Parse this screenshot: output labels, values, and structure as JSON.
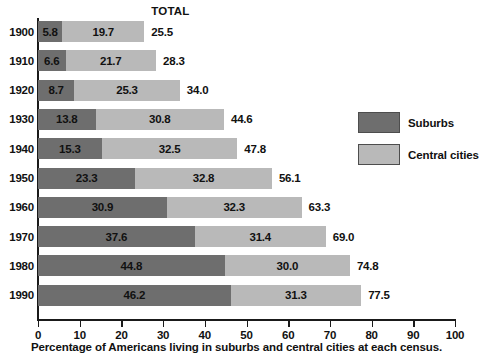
{
  "chart_data": {
    "type": "bar",
    "orientation": "horizontal",
    "stacked": true,
    "title": "",
    "caption": "Percentage of Americans living in suburbs and central cities at each census.",
    "total_header": "TOTAL",
    "xlabel": "",
    "ylabel": "",
    "xlim": [
      0,
      100
    ],
    "xticks": [
      0,
      10,
      20,
      30,
      40,
      50,
      60,
      70,
      80,
      90,
      100
    ],
    "xtick_labels": [
      "0",
      "10",
      "20",
      "30",
      "40",
      "50",
      "60",
      "70",
      "80",
      "90",
      "100"
    ],
    "grid": false,
    "legend_position": "right",
    "categories": [
      "1900",
      "1910",
      "1920",
      "1930",
      "1940",
      "1950",
      "1960",
      "1970",
      "1980",
      "1990"
    ],
    "series": [
      {
        "name": "Suburbs",
        "color": "#6e6e6e",
        "values": [
          5.8,
          6.6,
          8.7,
          13.8,
          15.3,
          23.3,
          30.9,
          37.6,
          44.8,
          46.2
        ],
        "labels": [
          "5.8",
          "6.6",
          "8.7",
          "13.8",
          "15.3",
          "23.3",
          "30.9",
          "37.6",
          "44.8",
          "46.2"
        ]
      },
      {
        "name": "Central cities",
        "color": "#b9b9b9",
        "values": [
          19.7,
          21.7,
          25.3,
          30.8,
          32.5,
          32.8,
          32.3,
          31.4,
          30.0,
          31.3
        ],
        "labels": [
          "19.7",
          "21.7",
          "25.3",
          "30.8",
          "32.5",
          "32.8",
          "32.3",
          "31.4",
          "30.0",
          "31.3"
        ]
      }
    ],
    "totals": [
      25.5,
      28.3,
      34.0,
      44.6,
      47.8,
      56.1,
      63.3,
      69.0,
      74.8,
      77.5
    ],
    "total_labels": [
      "25.5",
      "28.3",
      "34.0",
      "44.6",
      "47.8",
      "56.1",
      "63.3",
      "69.0",
      "74.8",
      "77.5"
    ]
  }
}
